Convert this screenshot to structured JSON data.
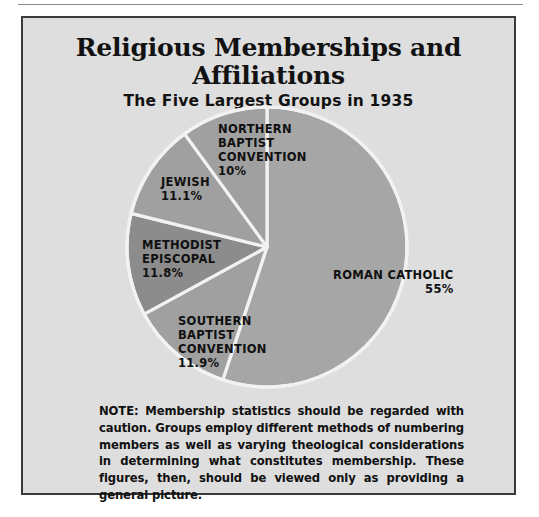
{
  "figure": {
    "title": "Religious Memberships and Affiliations",
    "subtitle": "The Five Largest Groups in 1935",
    "note": "NOTE: Membership statistics should be regarded with caution. Groups employ different methods of numbering members as well as varying theological considerations in determining what constitutes membership. These figures, then, should be viewed only as providing a general picture.",
    "background_color": "#dedede",
    "border_color": "#3a3a3a"
  },
  "labels": {
    "roman_catholic": {
      "name": "ROMAN CATHOLIC",
      "pct": "55%"
    },
    "southern_baptist": {
      "line1": "SOUTHERN",
      "line2": "BAPTIST",
      "line3": "CONVENTION",
      "pct": "11.9%"
    },
    "methodist_episcopal": {
      "line1": "METHODIST",
      "line2": "EPISCOPAL",
      "pct": "11.8%"
    },
    "jewish": {
      "name": "JEWISH",
      "pct": "11.1%"
    },
    "northern_baptist": {
      "line1": "NORTHERN",
      "line2": "BAPTIST",
      "line3": "CONVENTION",
      "pct": "10%"
    }
  },
  "chart_data": {
    "type": "pie",
    "title": "Religious Memberships and Affiliations",
    "subtitle": "The Five Largest Groups in 1935",
    "categories": [
      "ROMAN CATHOLIC",
      "SOUTHERN BAPTIST CONVENTION",
      "METHODIST EPISCOPAL",
      "JEWISH",
      "NORTHERN BAPTIST CONVENTION"
    ],
    "values": [
      55,
      11.9,
      11.8,
      11.1,
      10
    ],
    "value_labels": [
      "55%",
      "11.9%",
      "11.8%",
      "11.1%",
      "10%"
    ],
    "units": "percent",
    "total": 99.8,
    "start_angle_deg": 0,
    "direction": "clockwise",
    "slice_colors": [
      "#a6a6a6",
      "#a0a0a0",
      "#8c8c8c",
      "#a0a0a0",
      "#a0a0a0"
    ],
    "separator_color": "#f2f2f2",
    "legend": "none",
    "labels_position": "inside-slices",
    "note": "NOTE: Membership statistics should be regarded with caution. Groups employ different methods of numbering members as well as varying theological considerations in determining what constitutes membership. These figures, then, should be viewed only as providing a general picture."
  }
}
